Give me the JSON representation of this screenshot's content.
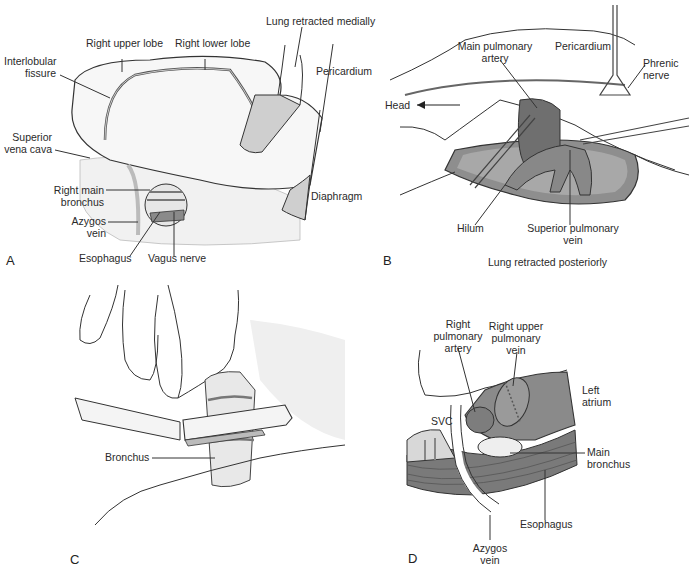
{
  "figure": {
    "panels": [
      {
        "id": "A",
        "letter": "A",
        "labels": {
          "right_upper_lobe": "Right upper lobe",
          "right_lower_lobe": "Right lower lobe",
          "lung_retracted_medially": "Lung retracted medially",
          "interlobular_fissure_1": "Interlobular",
          "interlobular_fissure_2": "fissure",
          "pericardium": "Pericardium",
          "superior_vena_cava_1": "Superior",
          "superior_vena_cava_2": "vena cava",
          "right_main_bronchus_1": "Right main",
          "right_main_bronchus_2": "bronchus",
          "diaphragm": "Diaphragm",
          "azygos_vein_1": "Azygos",
          "azygos_vein_2": "vein",
          "esophagus": "Esophagus",
          "vagus_nerve": "Vagus nerve"
        }
      },
      {
        "id": "B",
        "letter": "B",
        "caption": "Lung retracted posteriorly",
        "labels": {
          "main_pulmonary_artery_1": "Main pulmonary",
          "main_pulmonary_artery_2": "artery",
          "pericardium": "Pericardium",
          "phrenic_nerve_1": "Phrenic",
          "phrenic_nerve_2": "nerve",
          "head": "Head",
          "hilum": "Hilum",
          "superior_pulmonary_vein_1": "Superior pulmonary",
          "superior_pulmonary_vein_2": "vein"
        }
      },
      {
        "id": "C",
        "letter": "C",
        "labels": {
          "bronchus": "Bronchus"
        }
      },
      {
        "id": "D",
        "letter": "D",
        "labels": {
          "right_pulmonary_artery_1": "Right",
          "right_pulmonary_artery_2": "pulmonary",
          "right_pulmonary_artery_3": "artery",
          "right_upper_pulmonary_vein_1": "Right upper",
          "right_upper_pulmonary_vein_2": "pulmonary",
          "right_upper_pulmonary_vein_3": "vein",
          "left_atrium_1": "Left",
          "left_atrium_2": "atrium",
          "svc": "SVC",
          "main_bronchus_1": "Main",
          "main_bronchus_2": "bronchus",
          "esophagus": "Esophagus",
          "azygos_vein_1": "Azygos",
          "azygos_vein_2": "vein"
        }
      }
    ],
    "colors": {
      "ink": "#2a2a2a",
      "shade_light": "#d9d9d9",
      "shade_mid": "#9a9a9a",
      "shade_dark": "#6e6e6e",
      "background": "#ffffff"
    }
  }
}
